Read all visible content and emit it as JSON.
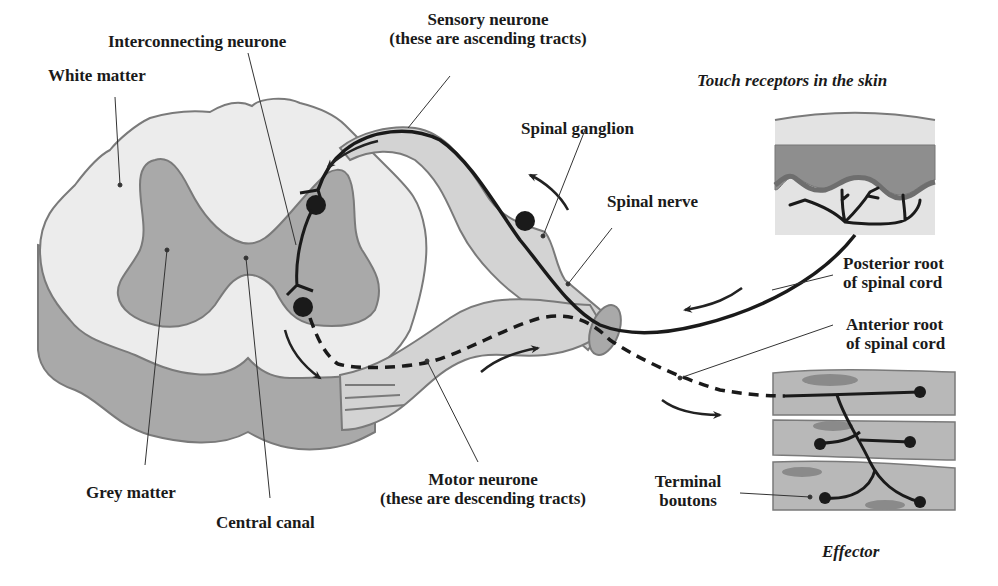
{
  "diagram": {
    "colors": {
      "white_matter": "#ececec",
      "grey_matter": "#a9a9a9",
      "nerve_light": "#d3d3d3",
      "outline": "#7a7a7a",
      "neuron": "#1a1a1a",
      "skin_top": "#e3e3e3",
      "skin_dermis": "#8e8e8e",
      "muscle": "#b8b8b8"
    },
    "labels": {
      "white_matter": "White matter",
      "interconnecting_neurone": "Interconnecting neurone",
      "sensory_neurone": "Sensory neurone",
      "sensory_neurone_note": "(these are ascending tracts)",
      "touch_receptors": "Touch receptors in the skin",
      "spinal_ganglion": "Spinal ganglion",
      "spinal_nerve": "Spinal nerve",
      "posterior_root_1": "Posterior root",
      "posterior_root_2": "of spinal cord",
      "anterior_root_1": "Anterior root",
      "anterior_root_2": "of spinal cord",
      "grey_matter": "Grey matter",
      "central_canal": "Central canal",
      "motor_neurone": "Motor neurone",
      "motor_neurone_note": "(these are descending tracts)",
      "terminal_boutons_1": "Terminal",
      "terminal_boutons_2": "boutons",
      "effector": "Effector"
    }
  }
}
